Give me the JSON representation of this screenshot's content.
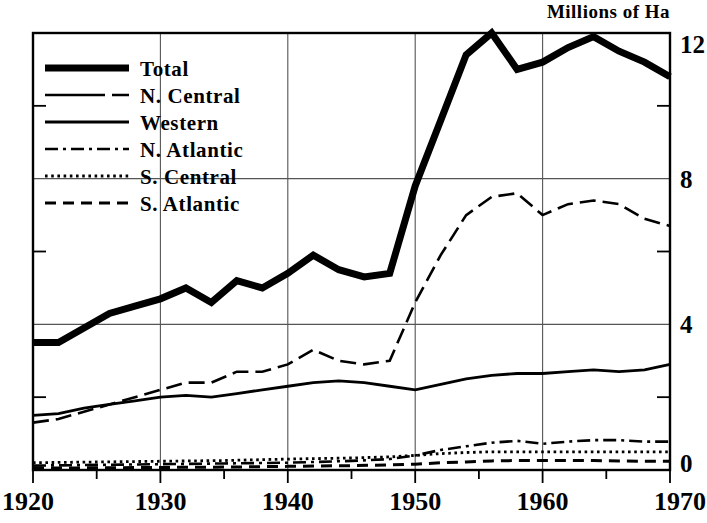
{
  "chart_data": {
    "type": "line",
    "title": "Millions of Ha",
    "xlabel": "",
    "ylabel": "Millions of Ha",
    "xlim": [
      1920,
      1970
    ],
    "ylim": [
      0,
      12
    ],
    "xticks": [
      1920,
      1930,
      1940,
      1950,
      1960,
      1970
    ],
    "xticklabels": [
      "1920",
      "1930",
      "1940",
      "1950",
      "1960",
      "1970"
    ],
    "xminorticks": [
      1925,
      1935,
      1945,
      1955,
      1965
    ],
    "yticks": [
      0,
      4,
      8,
      12
    ],
    "yticklabels": [
      "0",
      "4",
      "8",
      "12"
    ],
    "yminorticks": [
      2,
      6,
      10
    ],
    "grid": true,
    "grid_axes": "both",
    "legend_position": "upper-left inside plot",
    "series": [
      {
        "name": "Total",
        "style": "thick-solid",
        "x": [
          1920,
          1922,
          1924,
          1926,
          1928,
          1930,
          1932,
          1934,
          1936,
          1938,
          1940,
          1942,
          1944,
          1946,
          1948,
          1950,
          1952,
          1954,
          1956,
          1958,
          1960,
          1962,
          1964,
          1966,
          1968,
          1970
        ],
        "values": [
          3.5,
          3.5,
          3.9,
          4.3,
          4.5,
          4.7,
          5.0,
          4.6,
          5.2,
          5.0,
          5.4,
          5.9,
          5.5,
          5.3,
          5.4,
          7.8,
          9.6,
          11.4,
          12.0,
          11.0,
          11.2,
          11.6,
          11.9,
          11.5,
          11.2,
          10.8
        ]
      },
      {
        "name": "N. Central",
        "style": "long-dash",
        "x": [
          1920,
          1922,
          1924,
          1926,
          1928,
          1930,
          1932,
          1934,
          1936,
          1938,
          1940,
          1942,
          1944,
          1946,
          1948,
          1950,
          1952,
          1954,
          1956,
          1958,
          1960,
          1962,
          1964,
          1966,
          1968,
          1970
        ],
        "values": [
          1.3,
          1.4,
          1.6,
          1.8,
          2.0,
          2.2,
          2.4,
          2.4,
          2.7,
          2.7,
          2.9,
          3.3,
          3.0,
          2.9,
          3.0,
          4.6,
          5.9,
          7.0,
          7.5,
          7.6,
          7.0,
          7.3,
          7.4,
          7.3,
          6.9,
          6.7
        ]
      },
      {
        "name": "Western",
        "style": "thin-solid",
        "x": [
          1920,
          1922,
          1924,
          1926,
          1928,
          1930,
          1932,
          1934,
          1936,
          1938,
          1940,
          1942,
          1944,
          1946,
          1948,
          1950,
          1952,
          1954,
          1956,
          1958,
          1960,
          1962,
          1964,
          1966,
          1968,
          1970
        ],
        "values": [
          1.5,
          1.55,
          1.7,
          1.8,
          1.9,
          2.0,
          2.05,
          2.0,
          2.1,
          2.2,
          2.3,
          2.4,
          2.45,
          2.4,
          2.3,
          2.2,
          2.35,
          2.5,
          2.6,
          2.65,
          2.65,
          2.7,
          2.75,
          2.7,
          2.75,
          2.9
        ]
      },
      {
        "name": "N. Atlantic",
        "style": "dash-dot",
        "x": [
          1920,
          1925,
          1930,
          1935,
          1940,
          1945,
          1948,
          1950,
          1952,
          1954,
          1956,
          1958,
          1960,
          1962,
          1964,
          1966,
          1968,
          1970
        ],
        "values": [
          0.12,
          0.14,
          0.16,
          0.18,
          0.2,
          0.25,
          0.3,
          0.4,
          0.55,
          0.65,
          0.75,
          0.8,
          0.72,
          0.78,
          0.82,
          0.82,
          0.78,
          0.78
        ]
      },
      {
        "name": "S. Central",
        "style": "dotted",
        "x": [
          1920,
          1925,
          1930,
          1935,
          1940,
          1945,
          1948,
          1950,
          1952,
          1954,
          1956,
          1958,
          1960,
          1962,
          1964,
          1966,
          1968,
          1970
        ],
        "values": [
          0.2,
          0.22,
          0.24,
          0.26,
          0.3,
          0.33,
          0.36,
          0.4,
          0.45,
          0.48,
          0.5,
          0.5,
          0.5,
          0.5,
          0.5,
          0.5,
          0.5,
          0.5
        ]
      },
      {
        "name": "S. Atlantic",
        "style": "dashed",
        "x": [
          1920,
          1925,
          1930,
          1935,
          1940,
          1945,
          1948,
          1950,
          1952,
          1954,
          1956,
          1958,
          1960,
          1962,
          1964,
          1966,
          1968,
          1970
        ],
        "values": [
          0.05,
          0.06,
          0.07,
          0.08,
          0.1,
          0.12,
          0.14,
          0.16,
          0.2,
          0.22,
          0.25,
          0.26,
          0.26,
          0.26,
          0.26,
          0.25,
          0.24,
          0.24
        ]
      }
    ],
    "legend": [
      {
        "label": "Total",
        "style": "thick-solid"
      },
      {
        "label": "N. Central",
        "style": "long-dash"
      },
      {
        "label": "Western",
        "style": "thin-solid"
      },
      {
        "label": "N. Atlantic",
        "style": "dash-dot"
      },
      {
        "label": "S. Central",
        "style": "dotted"
      },
      {
        "label": "S. Atlantic",
        "style": "dashed"
      }
    ],
    "colors": {
      "ink": "#000000",
      "background": "#ffffff",
      "grid": "#555555"
    }
  }
}
